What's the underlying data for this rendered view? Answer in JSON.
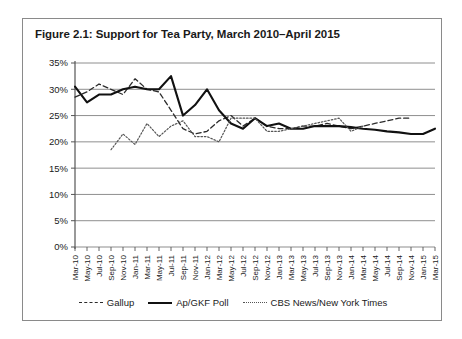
{
  "figure": {
    "title": "Figure 2.1: Support for Tea Party, March 2010–April 2015"
  },
  "legend": {
    "position": "bottom-center",
    "items": [
      {
        "label": "Gallup",
        "style": "dashed",
        "color": "#2b2b2b",
        "icon": "dashed-line-icon"
      },
      {
        "label": "Ap/GKF Poll",
        "style": "solid",
        "color": "#111111",
        "icon": "solid-line-icon"
      },
      {
        "label": "CBS News/New York Times",
        "style": "dotted",
        "color": "#555555",
        "icon": "dotted-line-icon"
      }
    ]
  },
  "chart_data": {
    "type": "line",
    "title": "Figure 2.1: Support for Tea Party, March 2010–April 2015",
    "xlabel": "",
    "ylabel": "",
    "ylim": [
      0,
      35
    ],
    "yticks": [
      "0%",
      "5%",
      "10%",
      "15%",
      "20%",
      "25%",
      "30%",
      "35%"
    ],
    "ytick_values": [
      0,
      5,
      10,
      15,
      20,
      25,
      30,
      35
    ],
    "grid": true,
    "grid_axis": "y",
    "legend_position": "bottom-center",
    "categories": [
      "Mar-10",
      "May-10",
      "Jul-10",
      "Sep-10",
      "Nov-10",
      "Jan-11",
      "Mar-11",
      "May-11",
      "Jul-11",
      "Sep-11",
      "Nov-11",
      "Jan-12",
      "Mar-12",
      "May-12",
      "Jul-12",
      "Sep-12",
      "Nov-12",
      "Jan-13",
      "Mar-13",
      "May-13",
      "Jul-13",
      "Sep-13",
      "Nov-13",
      "Jan-14",
      "Mar-14",
      "May-14",
      "Jul-14",
      "Sep-14",
      "Nov-14",
      "Jan-15",
      "Mar-15"
    ],
    "series": [
      {
        "name": "Gallup",
        "style": "dashed",
        "color": "#2b2b2b",
        "values": [
          28.5,
          29.5,
          31.0,
          30.0,
          29.0,
          32.0,
          30.0,
          29.5,
          26.0,
          22.5,
          21.5,
          22.0,
          24.0,
          25.0,
          23.0,
          24.5,
          23.0,
          22.5,
          22.5,
          23.0,
          23.0,
          23.5,
          23.0,
          22.5,
          23.0,
          23.5,
          24.0,
          24.5,
          24.5,
          null,
          null
        ]
      },
      {
        "name": "Ap/GKF Poll",
        "style": "solid",
        "color": "#111111",
        "values": [
          30.5,
          27.5,
          29.0,
          29.0,
          30.0,
          30.5,
          30.0,
          30.0,
          32.5,
          25.0,
          27.0,
          30.0,
          26.0,
          23.5,
          22.5,
          24.5,
          23.0,
          23.5,
          22.5,
          22.5,
          23.0,
          23.0,
          23.0,
          22.8,
          22.5,
          22.3,
          22.0,
          21.8,
          21.5,
          21.5,
          22.5
        ]
      },
      {
        "name": "CBS News/New York Times",
        "style": "dotted",
        "color": "#555555",
        "values": [
          null,
          null,
          null,
          18.5,
          21.5,
          19.5,
          23.5,
          21.0,
          23.0,
          24.0,
          21.0,
          21.0,
          20.0,
          24.5,
          24.5,
          24.5,
          22.0,
          22.0,
          22.5,
          23.0,
          23.5,
          24.0,
          24.5,
          22.0,
          23.0,
          null,
          null,
          null,
          null,
          null,
          null
        ]
      }
    ]
  }
}
